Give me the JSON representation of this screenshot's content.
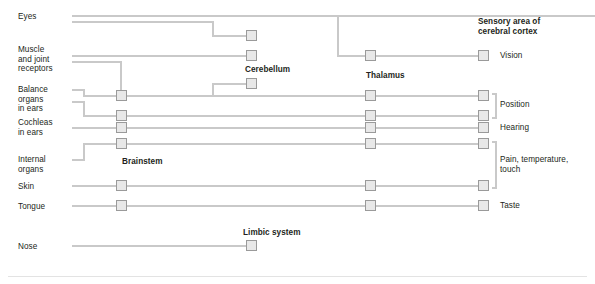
{
  "diagram": {
    "title_implicit": "Sensory pathways to the brain",
    "colors": {
      "line": "#c9c9c9",
      "box_fill": "#e8e8e8",
      "box_border": "#9a9a9a",
      "text": "#231f20",
      "rule": "#e3e3e3"
    },
    "source_labels": [
      {
        "name": "eyes",
        "text": "Eyes",
        "x": 18,
        "y": 14
      },
      {
        "name": "muscle-and-joint-receptors",
        "text": "Muscle\nand joint\nreceptors",
        "x": 18,
        "y": 47
      },
      {
        "name": "balance-organs-in-ears",
        "text": "Balance\norgans\nin ears",
        "x": 18,
        "y": 85
      },
      {
        "name": "cochleas-in-ears",
        "text": "Cochleas\nin ears",
        "x": 18,
        "y": 118
      },
      {
        "name": "internal-organs",
        "text": "Internal\norgans",
        "x": 18,
        "y": 155
      },
      {
        "name": "skin",
        "text": "Skin",
        "x": 18,
        "y": 182
      },
      {
        "name": "tongue",
        "text": "Tongue",
        "x": 18,
        "y": 202
      },
      {
        "name": "nose",
        "text": "Nose",
        "x": 18,
        "y": 243
      }
    ],
    "structure_labels": [
      {
        "name": "brainstem",
        "text": "Brainstem",
        "x": 122,
        "y": 158
      },
      {
        "name": "cerebellum",
        "text": "Cerebellum",
        "x": 245,
        "y": 66
      },
      {
        "name": "thalamus",
        "text": "Thalamus",
        "x": 366,
        "y": 72
      },
      {
        "name": "limbic-system",
        "text": "Limbic system",
        "x": 243,
        "y": 229
      },
      {
        "name": "sensory-area-of-cerebral-cortex",
        "text": "Sensory area of\ncerebral cortex",
        "x": 478,
        "y": 18
      }
    ],
    "cortex_function_labels": [
      {
        "name": "vision",
        "text": "Vision",
        "x": 500,
        "y": 54
      },
      {
        "name": "position",
        "text": "Position",
        "x": 500,
        "y": 102
      },
      {
        "name": "hearing",
        "text": "Hearing",
        "x": 500,
        "y": 124
      },
      {
        "name": "pain-temperature-touch",
        "text": "Pain, temperature,\ntouch",
        "x": 500,
        "y": 154
      },
      {
        "name": "taste",
        "text": "Taste",
        "x": 500,
        "y": 202
      }
    ],
    "brainstem_nodes": [
      {
        "name": "brainstem-node-1",
        "x": 116,
        "y": 90
      },
      {
        "name": "brainstem-node-2",
        "x": 116,
        "y": 110
      },
      {
        "name": "brainstem-node-3",
        "x": 116,
        "y": 122
      },
      {
        "name": "brainstem-node-4",
        "x": 116,
        "y": 138
      },
      {
        "name": "brainstem-node-5",
        "x": 116,
        "y": 180
      },
      {
        "name": "brainstem-node-6",
        "x": 116,
        "y": 200
      }
    ],
    "cerebellum_nodes": [
      {
        "name": "cerebellum-node-1",
        "x": 246,
        "y": 30
      },
      {
        "name": "cerebellum-node-2",
        "x": 246,
        "y": 50
      },
      {
        "name": "cerebellum-node-3",
        "x": 246,
        "y": 78
      }
    ],
    "thalamus_nodes": [
      {
        "name": "thalamus-node-vision",
        "x": 365,
        "y": 50
      },
      {
        "name": "thalamus-node-position-1",
        "x": 365,
        "y": 90
      },
      {
        "name": "thalamus-node-position-2",
        "x": 365,
        "y": 110
      },
      {
        "name": "thalamus-node-hearing",
        "x": 365,
        "y": 122
      },
      {
        "name": "thalamus-node-pain-1",
        "x": 365,
        "y": 138
      },
      {
        "name": "thalamus-node-pain-2",
        "x": 365,
        "y": 180
      },
      {
        "name": "thalamus-node-taste",
        "x": 365,
        "y": 200
      }
    ],
    "cortex_nodes": [
      {
        "name": "cortex-node-vision",
        "x": 478,
        "y": 50
      },
      {
        "name": "cortex-node-position-1",
        "x": 478,
        "y": 90
      },
      {
        "name": "cortex-node-position-2",
        "x": 478,
        "y": 110
      },
      {
        "name": "cortex-node-hearing",
        "x": 478,
        "y": 122
      },
      {
        "name": "cortex-node-pain-1",
        "x": 478,
        "y": 138
      },
      {
        "name": "cortex-node-pain-2",
        "x": 478,
        "y": 180
      },
      {
        "name": "cortex-node-taste",
        "x": 478,
        "y": 200
      }
    ],
    "limbic_node": {
      "name": "limbic-system-node",
      "x": 246,
      "y": 240
    },
    "pathways": [
      {
        "name": "eyes-to-thalamus",
        "from": "Eyes",
        "to": "Thalamus",
        "then": "Vision"
      },
      {
        "name": "eyes-to-cerebellum",
        "from": "Eyes",
        "to": "Cerebellum"
      },
      {
        "name": "muscle-joint-to-cerebellum",
        "from": "Muscle and joint receptors",
        "to": "Cerebellum"
      },
      {
        "name": "muscle-joint-to-brainstem",
        "from": "Muscle and joint receptors",
        "to": "Brainstem",
        "then": "Thalamus, Position"
      },
      {
        "name": "balance-to-cerebellum",
        "from": "Balance organs in ears",
        "to": "Cerebellum"
      },
      {
        "name": "balance-to-brainstem",
        "from": "Balance organs in ears",
        "to": "Brainstem",
        "then": "Thalamus, Position"
      },
      {
        "name": "cochleas-to-brainstem",
        "from": "Cochleas in ears",
        "to": "Brainstem",
        "then": "Thalamus, Hearing"
      },
      {
        "name": "internal-organs-to-brainstem",
        "from": "Internal organs",
        "to": "Brainstem",
        "then": "Thalamus, Pain, temperature, touch"
      },
      {
        "name": "skin-to-brainstem",
        "from": "Skin",
        "to": "Brainstem",
        "then": "Thalamus, Pain, temperature, touch"
      },
      {
        "name": "tongue-to-brainstem",
        "from": "Tongue",
        "to": "Brainstem",
        "then": "Thalamus, Taste"
      },
      {
        "name": "nose-to-limbic",
        "from": "Nose",
        "to": "Limbic system"
      }
    ]
  }
}
